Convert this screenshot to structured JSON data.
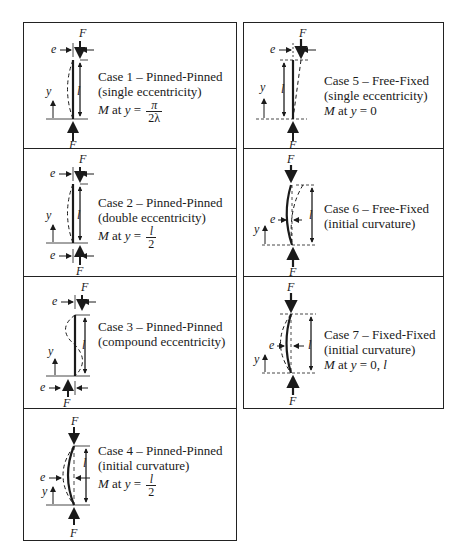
{
  "figure": {
    "left_column": [
      {
        "id": 1,
        "title": "Case 1 – Pinned-Pinned",
        "subtitle": "(single eccentricity)",
        "moment_prefix": "M",
        "moment_mid": " at ",
        "moment_var": "y",
        "moment_eq": " = ",
        "frac_num": "π",
        "frac_den": "2λ",
        "labels": {
          "force_top": "F",
          "force_bottom": "F",
          "ecc": "e",
          "length": "l",
          "y": "y"
        }
      },
      {
        "id": 2,
        "title": "Case 2 – Pinned-Pinned",
        "subtitle": "(double eccentricity)",
        "moment_prefix": "M",
        "moment_mid": " at ",
        "moment_var": "y",
        "moment_eq": " = ",
        "frac_num": "l",
        "frac_den": "2",
        "labels": {
          "force_top": "F",
          "force_bottom": "F",
          "ecc_top": "e",
          "ecc_bottom": "e",
          "length": "l",
          "y": "y"
        }
      },
      {
        "id": 3,
        "title": "Case 3 – Pinned-Pinned",
        "subtitle": "(compound eccentricity)",
        "labels": {
          "force_top": "F",
          "force_bottom": "F",
          "ecc_top": "e",
          "ecc_bottom": "e",
          "length": "l",
          "y": "y"
        }
      },
      {
        "id": 4,
        "title": "Case 4 – Pinned-Pinned",
        "subtitle": "(initial curvature)",
        "moment_prefix": "M",
        "moment_mid": " at ",
        "moment_var": "y",
        "moment_eq": " = ",
        "frac_num": "l",
        "frac_den": "2",
        "labels": {
          "force_top": "F",
          "force_bottom": "F",
          "ecc": "e",
          "length": "l",
          "y": "y"
        }
      }
    ],
    "right_column": [
      {
        "id": 5,
        "title": "Case 5 – Free-Fixed",
        "subtitle": "(single eccentricity)",
        "moment_prefix": "M",
        "moment_mid": " at ",
        "moment_var": "y",
        "moment_tail": " = 0",
        "labels": {
          "force_top": "F",
          "force_bottom": "F",
          "ecc": "e",
          "length": "l",
          "y": "y"
        }
      },
      {
        "id": 6,
        "title": "Case 6 – Free-Fixed",
        "subtitle": "(initial curvature)",
        "labels": {
          "force_top": "F",
          "force_bottom": "F",
          "ecc": "e",
          "length": "l",
          "y": "y"
        }
      },
      {
        "id": 7,
        "title": "Case 7 – Fixed-Fixed",
        "subtitle": "(initial curvature)",
        "moment_prefix": "M",
        "moment_mid": " at ",
        "moment_var": "y",
        "moment_tail": " = 0, ",
        "moment_tail_var": "l",
        "labels": {
          "force_top": "F",
          "force_bottom": "F",
          "ecc": "e",
          "length": "l",
          "y": "y"
        }
      }
    ]
  }
}
